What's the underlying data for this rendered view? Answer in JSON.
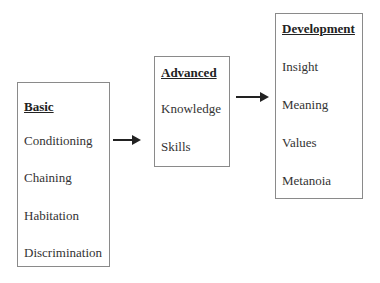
{
  "diagram": {
    "boxes": [
      {
        "title": "Basic",
        "items": [
          "Conditioning",
          "Chaining",
          "Habitation",
          "Discrimination"
        ]
      },
      {
        "title": "Advanced",
        "items": [
          "Knowledge",
          "Skills"
        ]
      },
      {
        "title": "Development",
        "items": [
          "Insight",
          "Meaning",
          "Values",
          "Metanoia"
        ]
      }
    ],
    "arrows": [
      {
        "from": "Basic",
        "to": "Advanced"
      },
      {
        "from": "Advanced",
        "to": "Development"
      }
    ],
    "colors": {
      "border": "#8a8a8a",
      "arrow": "#222222",
      "text": "#2a2a2a"
    }
  }
}
